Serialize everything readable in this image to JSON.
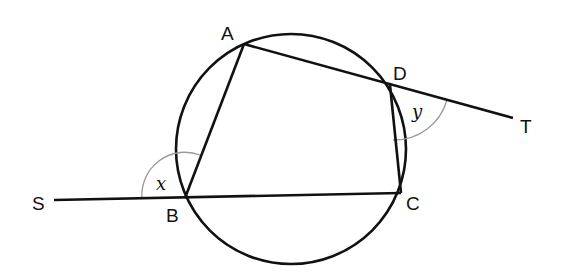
{
  "diagram": {
    "type": "cyclic-quadrilateral",
    "circle": {
      "cx": 291,
      "cy": 149,
      "r": 115
    },
    "points": {
      "A": {
        "label": "A",
        "x": 244,
        "y": 44,
        "lx": 221,
        "ly": 40
      },
      "B": {
        "label": "B",
        "x": 185,
        "y": 198,
        "lx": 166,
        "ly": 221
      },
      "C": {
        "label": "C",
        "x": 401,
        "y": 193,
        "lx": 406,
        "ly": 210
      },
      "D": {
        "label": "D",
        "x": 390,
        "y": 85,
        "lx": 393,
        "ly": 80
      },
      "S": {
        "label": "S",
        "x": 54,
        "y": 200,
        "lx": 32,
        "ly": 210
      },
      "T": {
        "label": "T",
        "x": 513,
        "y": 118,
        "lx": 520,
        "ly": 133
      }
    },
    "angles": {
      "x": {
        "label": "x",
        "at": "B"
      },
      "y": {
        "label": "y",
        "at": "D"
      }
    },
    "colors": {
      "stroke": "#111111",
      "arc": "#999999"
    }
  }
}
